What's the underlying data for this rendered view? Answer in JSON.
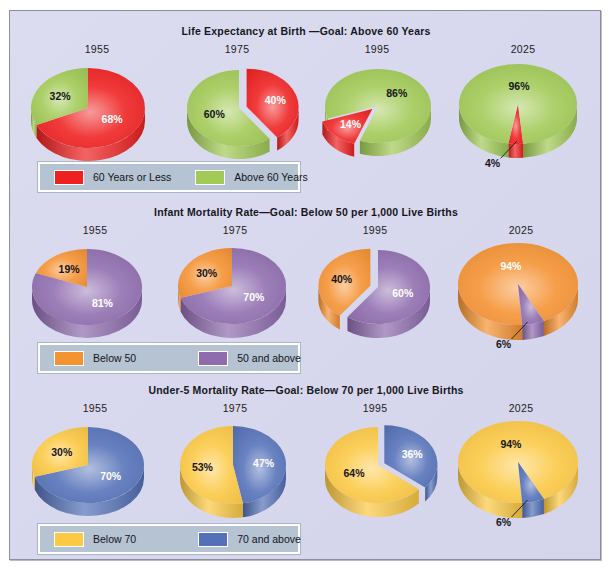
{
  "poster": {
    "background_color": "#d8d8ee",
    "border_color": "#8d8d9e"
  },
  "panels": [
    {
      "id": "life-expectancy",
      "title": "Life Expectancy at Birth —Goal: Above 60 Years",
      "legend": [
        {
          "label": "60 Years or Less",
          "color": "#ef2020"
        },
        {
          "label": "Above 60 Years",
          "color": "#a2ca56"
        }
      ],
      "years": [
        "1955",
        "1975",
        "1995",
        "2025"
      ]
    },
    {
      "id": "infant-mortality",
      "title": "Infant Mortality Rate—Goal: Below 50 per 1,000 Live Births",
      "legend": [
        {
          "label": "Below 50",
          "color": "#f59232"
        },
        {
          "label": "50 and above",
          "color": "#8e6cae"
        }
      ],
      "years": [
        "1955",
        "1975",
        "1995",
        "2025"
      ]
    },
    {
      "id": "under5-mortality",
      "title": "Under-5 Mortality Rate—Goal: Below 70 per 1,000 Live Births",
      "legend": [
        {
          "label": "Below 70",
          "color": "#fcc944"
        },
        {
          "label": "70 and above",
          "color": "#5471b8"
        }
      ],
      "years": [
        "1955",
        "1975",
        "1995",
        "2025"
      ]
    }
  ],
  "chart_data": [
    {
      "type": "pie",
      "title": "Life Expectancy at Birth —Goal: Above 60 Years",
      "legend_position": "bottom-left",
      "charts": [
        {
          "label": "1955",
          "slices": [
            {
              "name": "60 Years or Less",
              "value": 68,
              "display": "68%",
              "color": "#ef2020",
              "label_color": "#ffffff",
              "exploded": false
            },
            {
              "name": "Above 60 Years",
              "value": 32,
              "display": "32%",
              "color": "#a2ca56",
              "label_color": "#15151b",
              "exploded": false
            }
          ]
        },
        {
          "label": "1975",
          "slices": [
            {
              "name": "60 Years or Less",
              "value": 40,
              "display": "40%",
              "color": "#ef2020",
              "label_color": "#ffffff",
              "exploded": true
            },
            {
              "name": "Above 60 Years",
              "value": 60,
              "display": "60%",
              "color": "#a2ca56",
              "label_color": "#15151b",
              "exploded": false
            }
          ]
        },
        {
          "label": "1995",
          "slices": [
            {
              "name": "60 Years or Less",
              "value": 14,
              "display": "14%",
              "color": "#ef2020",
              "label_color": "#ffffff",
              "exploded": true
            },
            {
              "name": "Above 60 Years",
              "value": 86,
              "display": "86%",
              "color": "#a2ca56",
              "label_color": "#15151b",
              "exploded": false
            }
          ]
        },
        {
          "label": "2025",
          "slices": [
            {
              "name": "60 Years or Less",
              "value": 4,
              "display": "4%",
              "color": "#ef2020",
              "label_color": "#15151b",
              "exploded": false,
              "callout": true
            },
            {
              "name": "Above 60 Years",
              "value": 96,
              "display": "96%",
              "color": "#a2ca56",
              "label_color": "#15151b",
              "exploded": false
            }
          ]
        }
      ]
    },
    {
      "type": "pie",
      "title": "Infant Mortality Rate—Goal: Below 50 per 1,000 Live Births",
      "legend_position": "bottom-left",
      "charts": [
        {
          "label": "1955",
          "slices": [
            {
              "name": "50 and above",
              "value": 81,
              "display": "81%",
              "color": "#8e6cae",
              "label_color": "#ffffff",
              "exploded": false
            },
            {
              "name": "Below 50",
              "value": 19,
              "display": "19%",
              "color": "#f59232",
              "label_color": "#15151b",
              "exploded": false
            }
          ]
        },
        {
          "label": "1975",
          "slices": [
            {
              "name": "50 and above",
              "value": 70,
              "display": "70%",
              "color": "#8e6cae",
              "label_color": "#ffffff",
              "exploded": false
            },
            {
              "name": "Below 50",
              "value": 30,
              "display": "30%",
              "color": "#f59232",
              "label_color": "#15151b",
              "exploded": false
            }
          ]
        },
        {
          "label": "1995",
          "slices": [
            {
              "name": "50 and above",
              "value": 60,
              "display": "60%",
              "color": "#8e6cae",
              "label_color": "#ffffff",
              "exploded": false
            },
            {
              "name": "Below 50",
              "value": 40,
              "display": "40%",
              "color": "#f59232",
              "label_color": "#15151b",
              "exploded": true
            }
          ]
        },
        {
          "label": "2025",
          "slices": [
            {
              "name": "Below 50",
              "value": 94,
              "display": "94%",
              "color": "#f59232",
              "label_color": "#ffffff",
              "exploded": false
            },
            {
              "name": "50 and above",
              "value": 6,
              "display": "6%",
              "color": "#8e6cae",
              "label_color": "#15151b",
              "exploded": false,
              "callout": true
            }
          ]
        }
      ]
    },
    {
      "type": "pie",
      "title": "Under-5 Mortality Rate—Goal: Below 70 per 1,000 Live Births",
      "legend_position": "bottom-left",
      "charts": [
        {
          "label": "1955",
          "slices": [
            {
              "name": "70 and above",
              "value": 70,
              "display": "70%",
              "color": "#5471b8",
              "label_color": "#ffffff",
              "exploded": false
            },
            {
              "name": "Below 70",
              "value": 30,
              "display": "30%",
              "color": "#fcc944",
              "label_color": "#15151b",
              "exploded": false
            }
          ]
        },
        {
          "label": "1975",
          "slices": [
            {
              "name": "70 and above",
              "value": 47,
              "display": "47%",
              "color": "#5471b8",
              "label_color": "#ffffff",
              "exploded": false
            },
            {
              "name": "Below 70",
              "value": 53,
              "display": "53%",
              "color": "#fcc944",
              "label_color": "#15151b",
              "exploded": false
            }
          ]
        },
        {
          "label": "1995",
          "slices": [
            {
              "name": "70 and above",
              "value": 36,
              "display": "36%",
              "color": "#5471b8",
              "label_color": "#ffffff",
              "exploded": true
            },
            {
              "name": "Below 70",
              "value": 64,
              "display": "64%",
              "color": "#fcc944",
              "label_color": "#15151b",
              "exploded": false
            }
          ]
        },
        {
          "label": "2025",
          "slices": [
            {
              "name": "Below 70",
              "value": 94,
              "display": "94%",
              "color": "#fcc944",
              "label_color": "#15151b",
              "exploded": false
            },
            {
              "name": "70 and above",
              "value": 6,
              "display": "6%",
              "color": "#5471b8",
              "label_color": "#15151b",
              "exploded": false,
              "callout": true
            }
          ]
        }
      ]
    }
  ]
}
